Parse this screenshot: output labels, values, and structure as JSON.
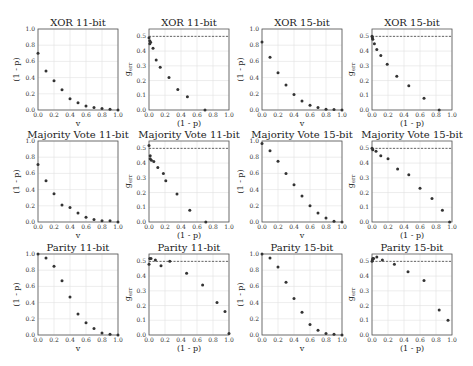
{
  "chart_data": [
    {
      "type": "scatter",
      "title": "XOR 11-bit",
      "xlabel": "v",
      "ylabel": "(1 - p)",
      "xlim": [
        0,
        1
      ],
      "ylim": [
        0,
        1
      ],
      "xticks": [
        "0.0",
        "0.2",
        "0.4",
        "0.6",
        "0.8",
        "1.0"
      ],
      "yticks": [
        "0.0",
        "0.2",
        "0.4",
        "0.6",
        "0.8",
        "1.0"
      ],
      "grid": true,
      "x": [
        0.0,
        0.1,
        0.2,
        0.3,
        0.4,
        0.5,
        0.6,
        0.7,
        0.8,
        0.9,
        1.0
      ],
      "y": [
        0.7,
        0.48,
        0.36,
        0.25,
        0.14,
        0.09,
        0.05,
        0.03,
        0.02,
        0.01,
        0.0
      ]
    },
    {
      "type": "scatter",
      "title": "XOR 11-bit",
      "xlabel": "(1 - p)",
      "ylabel": "g_err",
      "xlim": [
        0,
        1
      ],
      "ylim": [
        0,
        0.55
      ],
      "xticks": [
        "0.0",
        "0.2",
        "0.4",
        "0.6",
        "0.8",
        "1.0"
      ],
      "yticks": [
        "0.0",
        "0.1",
        "0.2",
        "0.3",
        "0.4",
        "0.5"
      ],
      "grid": true,
      "reference_line": {
        "y": 0.5,
        "style": "dashed"
      },
      "x": [
        0.0,
        0.01,
        0.01,
        0.02,
        0.05,
        0.09,
        0.14,
        0.25,
        0.36,
        0.48,
        0.7
      ],
      "y": [
        0.49,
        0.47,
        0.45,
        0.46,
        0.42,
        0.34,
        0.29,
        0.22,
        0.14,
        0.09,
        0.0
      ]
    },
    {
      "type": "scatter",
      "title": "XOR 15-bit",
      "xlabel": "v",
      "ylabel": "(1 - p)",
      "xlim": [
        0,
        1
      ],
      "ylim": [
        0,
        1
      ],
      "xticks": [
        "0.0",
        "0.2",
        "0.4",
        "0.6",
        "0.8",
        "1.0"
      ],
      "yticks": [
        "0.0",
        "0.2",
        "0.4",
        "0.6",
        "0.8",
        "1.0"
      ],
      "grid": true,
      "x": [
        0.0,
        0.1,
        0.2,
        0.3,
        0.4,
        0.5,
        0.6,
        0.7,
        0.8,
        0.9,
        1.0
      ],
      "y": [
        0.84,
        0.65,
        0.46,
        0.31,
        0.19,
        0.11,
        0.06,
        0.03,
        0.01,
        0.005,
        0.0
      ]
    },
    {
      "type": "scatter",
      "title": "XOR 15-bit",
      "xlabel": "(1 - p)",
      "ylabel": "g_err",
      "xlim": [
        0,
        1
      ],
      "ylim": [
        0,
        0.55
      ],
      "xticks": [
        "0.0",
        "0.2",
        "0.4",
        "0.6",
        "0.8",
        "1.0"
      ],
      "yticks": [
        "0.0",
        "0.1",
        "0.2",
        "0.3",
        "0.4",
        "0.5"
      ],
      "grid": true,
      "reference_line": {
        "y": 0.5,
        "style": "dashed"
      },
      "x": [
        0.0,
        0.005,
        0.01,
        0.03,
        0.06,
        0.11,
        0.19,
        0.31,
        0.46,
        0.65,
        0.84
      ],
      "y": [
        0.5,
        0.49,
        0.48,
        0.45,
        0.41,
        0.37,
        0.31,
        0.23,
        0.165,
        0.08,
        0.0
      ]
    },
    {
      "type": "scatter",
      "title": "Majority Vote 11-bit",
      "xlabel": "v",
      "ylabel": "(1 - p)",
      "xlim": [
        0,
        1
      ],
      "ylim": [
        0,
        1
      ],
      "xticks": [
        "0.0",
        "0.2",
        "0.4",
        "0.6",
        "0.8",
        "1.0"
      ],
      "yticks": [
        "0.0",
        "0.2",
        "0.4",
        "0.6",
        "0.8",
        "1.0"
      ],
      "grid": true,
      "x": [
        0.0,
        0.1,
        0.2,
        0.3,
        0.4,
        0.5,
        0.6,
        0.7,
        0.8,
        0.9,
        1.0
      ],
      "y": [
        0.71,
        0.51,
        0.35,
        0.21,
        0.18,
        0.11,
        0.06,
        0.03,
        0.015,
        0.015,
        0.0
      ]
    },
    {
      "type": "scatter",
      "title": "Majority Vote 11-bit",
      "xlabel": "(1 - p)",
      "ylabel": "g_err",
      "xlim": [
        0,
        1
      ],
      "ylim": [
        0,
        0.55
      ],
      "xticks": [
        "0.0",
        "0.2",
        "0.4",
        "0.6",
        "0.8",
        "1.0"
      ],
      "yticks": [
        "0.0",
        "0.1",
        "0.2",
        "0.3",
        "0.4",
        "0.5"
      ],
      "grid": true,
      "reference_line": {
        "y": 0.5,
        "style": "dashed"
      },
      "x": [
        0.0,
        0.015,
        0.015,
        0.03,
        0.06,
        0.11,
        0.18,
        0.21,
        0.35,
        0.51,
        0.71
      ],
      "y": [
        0.52,
        0.45,
        0.43,
        0.42,
        0.41,
        0.37,
        0.33,
        0.28,
        0.19,
        0.08,
        0.0
      ]
    },
    {
      "type": "scatter",
      "title": "Majority Vote 15-bit",
      "xlabel": "v",
      "ylabel": "(1 - p)",
      "xlim": [
        0,
        1
      ],
      "ylim": [
        0,
        1
      ],
      "xticks": [
        "0.0",
        "0.2",
        "0.4",
        "0.6",
        "0.8",
        "1.0"
      ],
      "yticks": [
        "0.0",
        "0.2",
        "0.4",
        "0.6",
        "0.8",
        "1.0"
      ],
      "grid": true,
      "x": [
        0.0,
        0.1,
        0.2,
        0.3,
        0.4,
        0.5,
        0.6,
        0.7,
        0.8,
        0.9,
        1.0
      ],
      "y": [
        0.97,
        0.88,
        0.75,
        0.6,
        0.46,
        0.32,
        0.2,
        0.11,
        0.05,
        0.01,
        0.0
      ]
    },
    {
      "type": "scatter",
      "title": "Majority Vote 15-bit",
      "xlabel": "(1 - p)",
      "ylabel": "g_err",
      "xlim": [
        0,
        1
      ],
      "ylim": [
        0,
        0.55
      ],
      "xticks": [
        "0.0",
        "0.2",
        "0.4",
        "0.6",
        "0.8",
        "1.0"
      ],
      "yticks": [
        "0.0",
        "0.1",
        "0.2",
        "0.3",
        "0.4",
        "0.5"
      ],
      "grid": true,
      "reference_line": {
        "y": 0.5,
        "style": "dashed"
      },
      "x": [
        0.0,
        0.01,
        0.05,
        0.11,
        0.2,
        0.32,
        0.46,
        0.6,
        0.75,
        0.88,
        0.97
      ],
      "y": [
        0.5,
        0.49,
        0.48,
        0.45,
        0.43,
        0.36,
        0.32,
        0.23,
        0.16,
        0.08,
        0.0
      ]
    },
    {
      "type": "scatter",
      "title": "Parity 11-bit",
      "xlabel": "v",
      "ylabel": "(1 - p)",
      "xlim": [
        0,
        1
      ],
      "ylim": [
        0,
        1
      ],
      "xticks": [
        "0.0",
        "0.2",
        "0.4",
        "0.6",
        "0.8",
        "1.0"
      ],
      "yticks": [
        "0.0",
        "0.2",
        "0.4",
        "0.6",
        "0.8",
        "1.0"
      ],
      "grid": true,
      "x": [
        0.0,
        0.1,
        0.2,
        0.3,
        0.4,
        0.5,
        0.6,
        0.7,
        0.8,
        0.9,
        1.0
      ],
      "y": [
        1.0,
        0.95,
        0.85,
        0.67,
        0.47,
        0.26,
        0.15,
        0.08,
        0.025,
        0.01,
        0.0
      ]
    },
    {
      "type": "scatter",
      "title": "Parity 11-bit",
      "xlabel": "(1 - p)",
      "ylabel": "g_err",
      "xlim": [
        0,
        1
      ],
      "ylim": [
        0,
        0.55
      ],
      "xticks": [
        "0.0",
        "0.2",
        "0.4",
        "0.6",
        "0.8",
        "1.0"
      ],
      "yticks": [
        "0.0",
        "0.1",
        "0.2",
        "0.3",
        "0.4",
        "0.5"
      ],
      "grid": true,
      "reference_line": {
        "y": 0.5,
        "style": "dashed"
      },
      "x": [
        0.0,
        0.01,
        0.025,
        0.08,
        0.15,
        0.26,
        0.47,
        0.67,
        0.85,
        0.95,
        1.0
      ],
      "y": [
        0.48,
        0.52,
        0.52,
        0.51,
        0.47,
        0.5,
        0.42,
        0.34,
        0.22,
        0.16,
        0.01
      ]
    },
    {
      "type": "scatter",
      "title": "Parity 15-bit",
      "xlabel": "v",
      "ylabel": "(1 - p)",
      "xlim": [
        0,
        1
      ],
      "ylim": [
        0,
        1
      ],
      "xticks": [
        "0.0",
        "0.2",
        "0.4",
        "0.6",
        "0.8",
        "1.0"
      ],
      "yticks": [
        "0.0",
        "0.2",
        "0.4",
        "0.6",
        "0.8",
        "1.0"
      ],
      "grid": true,
      "x": [
        0.0,
        0.1,
        0.2,
        0.3,
        0.4,
        0.5,
        0.6,
        0.7,
        0.8,
        0.9,
        1.0
      ],
      "y": [
        1.0,
        0.95,
        0.84,
        0.65,
        0.45,
        0.28,
        0.13,
        0.06,
        0.02,
        0.01,
        0.0
      ]
    },
    {
      "type": "scatter",
      "title": "Parity 15-bit",
      "xlabel": "(1 - p)",
      "ylabel": "g_err",
      "xlim": [
        0,
        1
      ],
      "ylim": [
        0,
        0.55
      ],
      "xticks": [
        "0.0",
        "0.2",
        "0.4",
        "0.6",
        "0.8",
        "1.0"
      ],
      "yticks": [
        "0.0",
        "0.1",
        "0.2",
        "0.3",
        "0.4",
        "0.5"
      ],
      "grid": true,
      "reference_line": {
        "y": 0.5,
        "style": "dashed"
      },
      "x": [
        0.0,
        0.005,
        0.01,
        0.02,
        0.06,
        0.13,
        0.28,
        0.45,
        0.65,
        0.84,
        0.95
      ],
      "y": [
        0.5,
        0.51,
        0.52,
        0.52,
        0.53,
        0.51,
        0.48,
        0.43,
        0.37,
        0.17,
        0.1
      ]
    }
  ],
  "layout": {
    "columns_left": [
      38,
      149,
      262,
      372
    ],
    "rows_top": [
      29,
      141,
      254
    ],
    "axes_width": 80,
    "axes_height": 81
  }
}
